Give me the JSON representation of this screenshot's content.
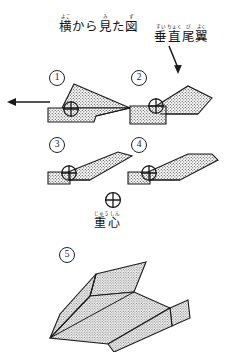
{
  "page": {
    "kind": "paper-airplane-folding-instructions",
    "background_color": "#ffffff",
    "ink_color": "#1a1a1a"
  },
  "title": {
    "text": "横から見た図",
    "romaji_meaning": "View from the side",
    "ruby": [
      {
        "base": "横",
        "rt": "よこ"
      },
      {
        "base": "か",
        "rt": ""
      },
      {
        "base": "ら",
        "rt": ""
      },
      {
        "base": "見",
        "rt": "み"
      },
      {
        "base": "た",
        "rt": ""
      },
      {
        "base": "図",
        "rt": "ず"
      }
    ]
  },
  "vertical_stabilizer_label": {
    "text": "垂直尾翼",
    "meaning": "vertical tail fin",
    "ruby": [
      {
        "base": "垂",
        "rt": "すい"
      },
      {
        "base": "直",
        "rt": "ちょく"
      },
      {
        "base": "尾",
        "rt": "び"
      },
      {
        "base": "翼",
        "rt": "よく"
      }
    ]
  },
  "center_of_gravity_label": {
    "symbol": "circled-plus",
    "text": "重心",
    "meaning": "center of gravity",
    "ruby": [
      {
        "base": "重",
        "rt": "じゅう"
      },
      {
        "base": "心",
        "rt": "しん"
      }
    ]
  },
  "direction_arrow": {
    "name": "flight-direction-arrow",
    "points": "left"
  },
  "pointer_arrow": {
    "name": "vertical-stabilizer-pointer-arrow",
    "points": "down"
  },
  "steps": [
    {
      "number": "1",
      "label": "①",
      "view": "side"
    },
    {
      "number": "2",
      "label": "②",
      "view": "side"
    },
    {
      "number": "3",
      "label": "③",
      "view": "side"
    },
    {
      "number": "4",
      "label": "④",
      "view": "side"
    },
    {
      "number": "5",
      "label": "⑤",
      "view": "perspective"
    }
  ]
}
